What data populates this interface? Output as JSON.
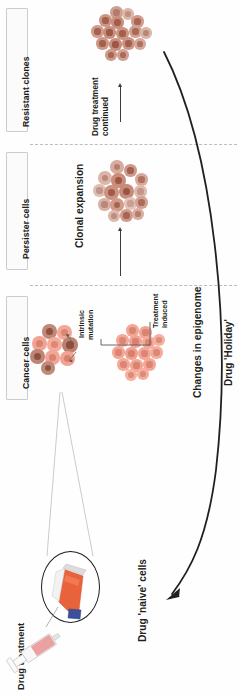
{
  "figure": {
    "orientation": "rotated-90-ccw"
  },
  "stages": [
    {
      "id": "resistant-clones",
      "label": "Resistant clones"
    },
    {
      "id": "persister-cells",
      "label": "Persister cells"
    },
    {
      "id": "cancer-cells",
      "label": "Cancer cells"
    }
  ],
  "annotations": {
    "drug_treatment_continued": "Drug treatment\ncontinued",
    "drug_treatment_continued_line1": "Drug treatment",
    "drug_treatment_continued_line2": "continued",
    "clonal_expansion": "Clonal expansion",
    "intrinsic_mutation_line1": "Intrinsic",
    "intrinsic_mutation_line2": "mutation",
    "treatment_induced_line1": "Treatment",
    "treatment_induced_line2": "induced",
    "changes_in_epigenome": "Changes in epigenome",
    "drug_holiday": "Drug 'Holiday'",
    "drug_naive_cells": "Drug 'naive' cells",
    "drug_treatment": "Drug treatment"
  },
  "colors": {
    "cell_pink_fill": "#f4a392",
    "cell_pink_nucleus": "#d9806e",
    "cell_brown_fill": "#c98878",
    "cell_brown_nucleus": "#a3634f",
    "cell_resistant_fill": "#cd9384",
    "cell_resistant_nucleus": "#a86353",
    "cell_persister_fill": "#d79a8b",
    "cell_persister_nucleus": "#a9614f",
    "flask_medium": "#e8623c",
    "flask_cap": "#3b4f9c",
    "syringe_liquid": "#eaa1a1",
    "line_dark": "#231f20",
    "divider": "#b9bdc4",
    "box_border": "#c9ccd1"
  },
  "clusters": [
    {
      "id": "resistant-clone-cluster",
      "stage": "resistant-clones",
      "cell_count": 16,
      "description": "Uniform dark resistant clone cells"
    },
    {
      "id": "persister-cluster",
      "stage": "persister-cells",
      "cell_count": 16,
      "description": "Mixed persister cells undergoing clonal expansion"
    },
    {
      "id": "cancer-cluster-mutation",
      "stage": "cancer-cells",
      "cell_count": 9,
      "description": "Cancer cells with intrinsic mutation subclones"
    },
    {
      "id": "cancer-cluster-epigenetic",
      "stage": "cancer-cells",
      "cell_count": 15,
      "description": "Cancer cells with treatment-induced epigenetic changes"
    }
  ],
  "objects": {
    "culture_flask": "culture-flask",
    "syringe": "syringe",
    "magnifier_circle": "magnifier-circle",
    "drug_holiday_arrow": "curved-return-arrow"
  }
}
